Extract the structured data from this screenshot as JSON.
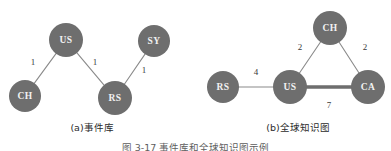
{
  "figure": {
    "caption": "图 3-17  事件库和全球知识图示例",
    "node_color": "#6e6e6e",
    "node_text_color": "#f2f2f2",
    "edge_color": "#8a8a8a",
    "thick_edge_color": "#6e6e6e"
  },
  "panels": [
    {
      "id": "a",
      "subcaption": "(a)事件库",
      "type": "node-link-graph",
      "nodes": [
        {
          "id": "US",
          "label": "US",
          "cx": 66,
          "cy": 40,
          "r": 17
        },
        {
          "id": "SY",
          "label": "SY",
          "cx": 154,
          "cy": 41,
          "r": 16
        },
        {
          "id": "CH",
          "label": "CH",
          "cx": 25,
          "cy": 96,
          "r": 16
        },
        {
          "id": "RS",
          "label": "RS",
          "cx": 115,
          "cy": 98,
          "r": 17
        }
      ],
      "edges": [
        {
          "source": "US",
          "target": "CH",
          "weight": "1",
          "lx": 33,
          "ly": 63,
          "thick": false
        },
        {
          "source": "US",
          "target": "RS",
          "weight": "1",
          "lx": 95,
          "ly": 63,
          "thick": false
        },
        {
          "source": "SY",
          "target": "RS",
          "weight": "1",
          "lx": 144,
          "ly": 71,
          "thick": false
        }
      ]
    },
    {
      "id": "b",
      "subcaption": "(b)全球知识图",
      "type": "node-link-graph",
      "nodes": [
        {
          "id": "CH",
          "label": "CH",
          "cx": 330,
          "cy": 28,
          "r": 17
        },
        {
          "id": "RS",
          "label": "RS",
          "cx": 223,
          "cy": 87,
          "r": 16
        },
        {
          "id": "US",
          "label": "US",
          "cx": 290,
          "cy": 87,
          "r": 17
        },
        {
          "id": "CA",
          "label": "CA",
          "cx": 368,
          "cy": 87,
          "r": 17
        }
      ],
      "edges": [
        {
          "source": "RS",
          "target": "US",
          "weight": "4",
          "lx": 256,
          "ly": 73,
          "thick": false
        },
        {
          "source": "US",
          "target": "CH",
          "weight": "2",
          "lx": 300,
          "ly": 48,
          "thick": false
        },
        {
          "source": "CH",
          "target": "CA",
          "weight": "2",
          "lx": 365,
          "ly": 48,
          "thick": false
        },
        {
          "source": "US",
          "target": "CA",
          "weight": "7",
          "lx": 329,
          "ly": 106,
          "thick": true
        }
      ]
    }
  ]
}
